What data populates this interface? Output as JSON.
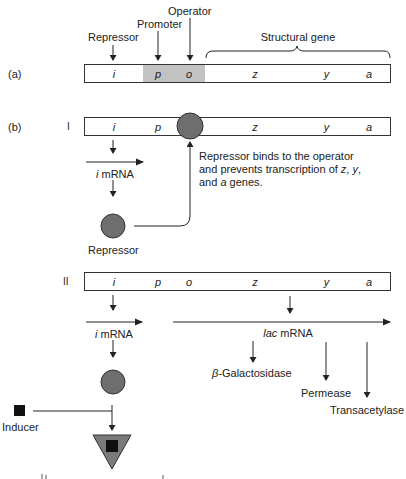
{
  "panel_labels": {
    "a": "(a)",
    "b": "(b)",
    "case1": "I",
    "case2": "II"
  },
  "top_labels": {
    "repressor": "Repressor",
    "promoter": "Promoter",
    "operator": "Operator",
    "structural_gene": "Structural gene"
  },
  "genes": [
    "i",
    "p",
    "o",
    "z",
    "y",
    "a"
  ],
  "case1": {
    "mrna_prefix": "i",
    "mrna_suffix": " mRNA",
    "protein_label": "Repressor",
    "note_line1": "Repressor binds to the operator",
    "note_line2_prefix": "and prevents transcription of ",
    "note_z": "z",
    "note_sep1": ", ",
    "note_y": "y",
    "note_sep2": ",",
    "note_line3_prefix": "and ",
    "note_a": "a",
    "note_line3_suffix": " genes."
  },
  "case2": {
    "mrna_prefix": "i",
    "mrna_suffix": " mRNA",
    "lac_prefix": "lac",
    "lac_suffix": " mRNA",
    "products": {
      "beta_gal_symbol": "β",
      "beta_gal": "-Galactosidase",
      "permease": "Permease",
      "transacetylase": "Transacetylase"
    },
    "inducer_label": "Inducer"
  },
  "colors": {
    "line": "#222222",
    "shaded_box": "#c2c2c2",
    "repressor_fill": "#6e6e6e",
    "repressor_stroke": "#333333",
    "inducer_fill": "#111111",
    "complex_fill": "#7a7a7a"
  }
}
